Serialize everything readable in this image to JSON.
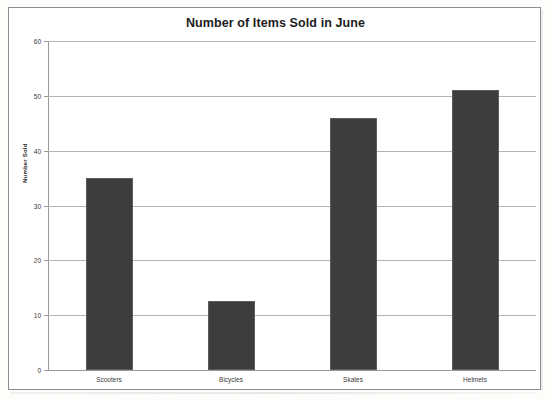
{
  "chart_data": {
    "type": "bar",
    "title": "Number of Items Sold in June",
    "xlabel": "",
    "ylabel": "Number Sold",
    "categories": [
      "Scooters",
      "Bicycles",
      "Skates",
      "Helmets"
    ],
    "values": [
      35,
      12.5,
      46,
      51
    ],
    "ylim": [
      0,
      60
    ],
    "ytick_labels": [
      "0",
      "10",
      "20",
      "30",
      "40",
      "50",
      "60"
    ],
    "ytick_values": [
      0,
      10,
      20,
      30,
      40,
      50,
      60
    ],
    "grid": true,
    "legend": false,
    "bar_color": "#3d3d3d",
    "gridline_color": "#b4b4b4",
    "axis_color": "#9a9a9a",
    "background_color": "#ffffff"
  }
}
